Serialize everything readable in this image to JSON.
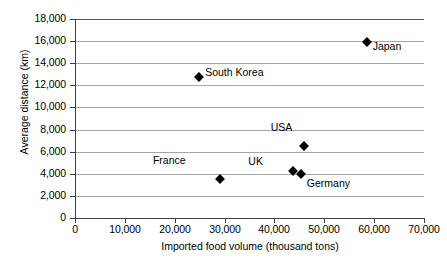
{
  "chart_data": {
    "type": "scatter",
    "title": "",
    "xlabel": "Imported food volume (thousand tons)",
    "ylabel": "Average distance (km)",
    "xlim": [
      0,
      70000
    ],
    "ylim": [
      0,
      18000
    ],
    "xticks": [
      "0",
      "10,000",
      "20,000",
      "30,000",
      "40,000",
      "50,000",
      "60,000",
      "70,000"
    ],
    "xtick_values": [
      0,
      10000,
      20000,
      30000,
      40000,
      50000,
      60000,
      70000
    ],
    "yticks": [
      "0",
      "2,000",
      "4,000",
      "6,000",
      "8,000",
      "10,000",
      "12,000",
      "14,000",
      "16,000",
      "18,000"
    ],
    "ytick_values": [
      0,
      2000,
      4000,
      6000,
      8000,
      10000,
      12000,
      14000,
      16000,
      18000
    ],
    "grid": "horizontal",
    "legend": "none",
    "marker_shape": "diamond",
    "marker_color": "#000000",
    "points": [
      {
        "label": "Japan",
        "x": 58500,
        "y": 15900,
        "label_dx": 6,
        "label_dy": 4
      },
      {
        "label": "South Korea",
        "x": 24900,
        "y": 12750,
        "label_dx": 6,
        "label_dy": -5
      },
      {
        "label": "USA",
        "x": 46000,
        "y": 6550,
        "label_dx": -12,
        "label_dy": -19
      },
      {
        "label": "UK",
        "x": 43700,
        "y": 4250,
        "label_dx": -30,
        "label_dy": -10
      },
      {
        "label": "Germany",
        "x": 45300,
        "y": 3950,
        "label_dx": 6,
        "label_dy": 9
      },
      {
        "label": "France",
        "x": 29000,
        "y": 3550,
        "label_dx": -34,
        "label_dy": -19
      }
    ]
  }
}
